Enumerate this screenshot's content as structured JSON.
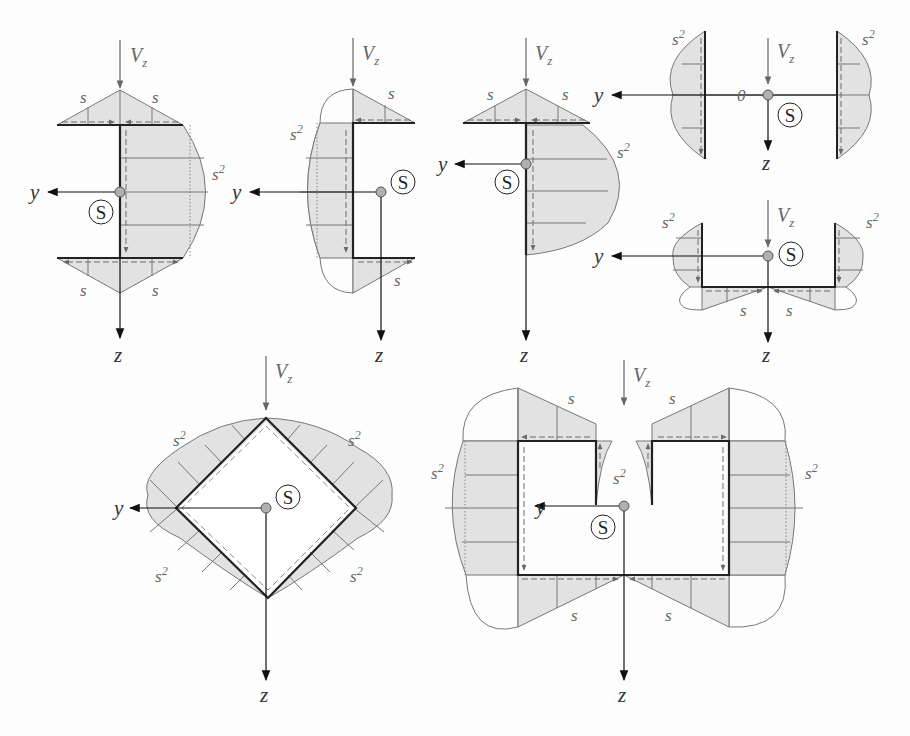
{
  "figure": {
    "colors": {
      "fill": "#e2e2e2",
      "outline": "#777777",
      "wall": "#222222",
      "arrow": "#6a6a6a",
      "centroid": "#b0b0b0"
    },
    "labels": {
      "force": "V",
      "force_sub": "z",
      "axis_y": "y",
      "axis_z": "z",
      "shear_center": "S",
      "linear": "s",
      "quadratic": "s",
      "quadratic_exp": "2",
      "zero": "0"
    },
    "panels": [
      {
        "id": "i-section-half",
        "name": "Channel with flanges (I-type) - parabolic web"
      },
      {
        "id": "channel",
        "name": "Channel (C) section"
      },
      {
        "id": "t-section",
        "name": "T section"
      },
      {
        "id": "twin-flange",
        "name": "Two flanges with web (zero flow in web)"
      },
      {
        "id": "u-section",
        "name": "U section with lips"
      },
      {
        "id": "diamond",
        "name": "Closed diamond (square rotated) section"
      },
      {
        "id": "slotted-box",
        "name": "Slotted box section"
      }
    ]
  }
}
